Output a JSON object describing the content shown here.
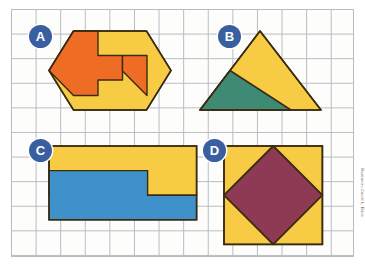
{
  "page": {
    "background_color": "#ffffff",
    "grid": {
      "line_color": "#b9bcc0",
      "cell_size_px": 24.6,
      "columns": 14,
      "rows": 10,
      "paper_color": "#fdfdfb"
    },
    "credit_text": "Illustration: Carole L. Eldon"
  },
  "palette": {
    "orange": "#ef6c25",
    "yellow": "#f8cb44",
    "blue": "#3f92c9",
    "green": "#3e8a74",
    "maroon": "#8e3a55",
    "outline": "#3b2a12",
    "badge_fill": "#3a5fa0",
    "badge_text": "#ffffff"
  },
  "shapes": [
    {
      "id": "A",
      "label": "A",
      "name": "hexagon-with-arrow-notch",
      "description": "Elongated hexagon divided into an orange region and a yellow region",
      "fill_colors": [
        "#ef6c25",
        "#f8cb44"
      ],
      "parts": [
        {
          "name": "hexagon-yellow-base",
          "color": "#f8cb44"
        },
        {
          "name": "orange-block-upper-left",
          "color": "#ef6c25"
        },
        {
          "name": "orange-arrow-band",
          "color": "#ef6c25"
        }
      ]
    },
    {
      "id": "B",
      "label": "B",
      "name": "triangle-with-green-sub-triangle",
      "description": "Yellow isosceles triangle containing a green triangle in the lower left",
      "fill_colors": [
        "#f8cb44",
        "#3e8a74"
      ],
      "parts": [
        {
          "name": "triangle-yellow",
          "color": "#f8cb44"
        },
        {
          "name": "triangle-green",
          "color": "#3e8a74"
        }
      ]
    },
    {
      "id": "C",
      "label": "C",
      "name": "stepped-rectangle-yellow-blue",
      "description": "Rectangle split into a yellow upper band and a blue lower region with a step",
      "fill_colors": [
        "#f8cb44",
        "#3f92c9"
      ],
      "parts": [
        {
          "name": "yellow-upper-band",
          "color": "#f8cb44"
        },
        {
          "name": "blue-lower-region",
          "color": "#3f92c9"
        }
      ]
    },
    {
      "id": "D",
      "label": "D",
      "name": "square-with-inscribed-diamond",
      "description": "Yellow square with a maroon diamond inscribed touching each side midpoint",
      "fill_colors": [
        "#f8cb44",
        "#8e3a55"
      ],
      "parts": [
        {
          "name": "square-yellow",
          "color": "#f8cb44"
        },
        {
          "name": "diamond-maroon",
          "color": "#8e3a55"
        }
      ]
    }
  ]
}
